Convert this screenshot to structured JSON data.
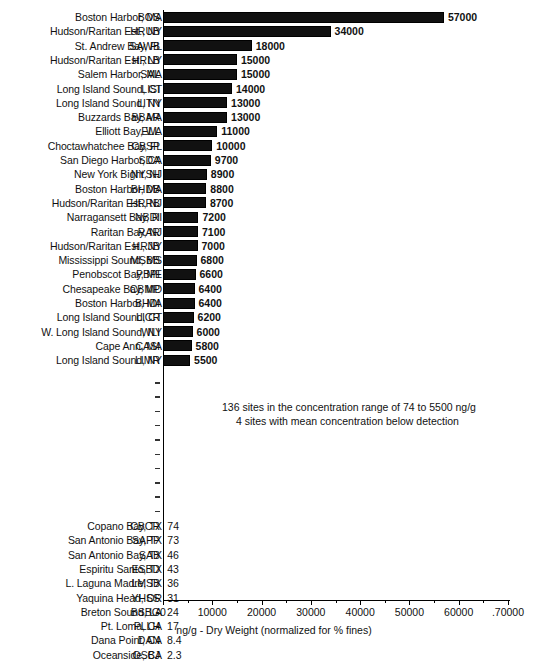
{
  "chart_data": {
    "type": "bar",
    "orientation": "horizontal",
    "title": "",
    "xlabel": "ng/g - Dry Weight (normalized for % fines)",
    "ylabel": "",
    "xlim": [
      0,
      70000
    ],
    "xticks": [
      0,
      10000,
      20000,
      30000,
      40000,
      50000,
      60000,
      70000
    ],
    "xtick_labels": [
      "0",
      "10000",
      "20000",
      "30000",
      "40000",
      "50000",
      "60000",
      ".70000"
    ],
    "grid": false,
    "legend": false,
    "categories": [
      "Boston Harbor, MA",
      "Hudson/Raritan Est., NY",
      "St. Andrew Bay, FL",
      "Hudson/Raritan Est., NY",
      "Salem Harbor, MA",
      "Long Island Sound, CT",
      "Long Island Sound, NY",
      "Buzzards Bay, MA",
      "Elliott Bay, WA",
      "Choctawhatchee Bay, FL",
      "San Diego Harbor, CA",
      "New York Bight, NJ",
      "Boston Harbor, MA",
      "Hudson/Raritan Est., NJ",
      "Narragansett Bay, RI",
      "Raritan Bay, NJ",
      "Hudson/Raritan Est., NY",
      "Mississippi Sound, MS",
      "Penobscot Bay, ME",
      "Chesapeake Bay, MD",
      "Boston Harbor, MA",
      "Long Island Sound, CT",
      "W. Long Island Sound, NY",
      "Cape Ann, MA",
      "Long Island Sound, NY",
      "Copano Bay, TX",
      "San Antonio Bay, TX",
      "San Antonio Bay, TX",
      "Espiritu Santo, TX",
      "L. Laguna Madre, TX",
      "Yaquina Head, OR",
      "Breton Sound, LA",
      "Pt. Loma, CA",
      "Dana Point, CA",
      "Oceanside, CA"
    ],
    "codes": [
      "BOS",
      "HRUB",
      "SAWB",
      "HRLB",
      "SAL",
      "LISI",
      "LITN",
      "BBAR",
      "ELL",
      "CBSP",
      "SDA",
      "NYSH",
      "BHDB",
      "HRRB",
      "NBDI",
      "RAR",
      "HRJB",
      "MSBB",
      "PBPI",
      "CBMP",
      "BHDI",
      "LICR",
      "WLI",
      "CASI",
      "LIMR",
      "CBCR",
      "SAPP",
      "SAB",
      "ESBD",
      "LMSB",
      "YHSS",
      "BSBG",
      "PLLH",
      "DAN",
      "OSBJ"
    ],
    "values": [
      57000,
      34000,
      18000,
      15000,
      15000,
      14000,
      13000,
      13000,
      11000,
      10000,
      9700,
      8900,
      8800,
      8700,
      7200,
      7100,
      7000,
      6800,
      6600,
      6400,
      6400,
      6200,
      6000,
      5800,
      5500,
      74,
      73,
      46,
      43,
      36,
      31,
      24,
      17,
      8.4,
      2.3
    ],
    "value_labels": [
      "57000",
      "34000",
      "18000",
      "15000",
      "15000",
      "14000",
      "13000",
      "13000",
      "11000",
      "10000",
      "9700",
      "8900",
      "8800",
      "8700",
      "7200",
      "7100",
      "7000",
      "6800",
      "6600",
      "6400",
      "6400",
      "6200",
      "6000",
      "5800",
      "5500",
      "74",
      "73",
      "46",
      "43",
      "36",
      "31",
      "24",
      "17",
      "8.4",
      "2.3"
    ],
    "annotations": [
      "136 sites in the concentration range of 74 to 5500 ng/g",
      "4 sites with mean concentration below detection"
    ],
    "break_marker_count": 10,
    "bar_color": "#111111"
  }
}
